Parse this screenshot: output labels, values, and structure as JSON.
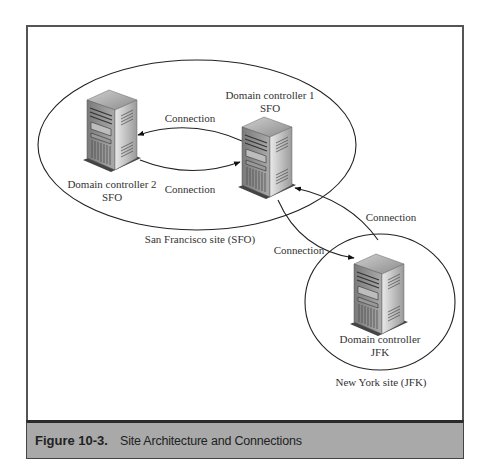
{
  "figure": {
    "number": "Figure 10-3.",
    "caption": "Site Architecture and Connections"
  },
  "sites": [
    {
      "id": "sfo",
      "label": "San Francisco site (SFO)"
    },
    {
      "id": "jfk",
      "label": "New York site (JFK)"
    }
  ],
  "servers": [
    {
      "id": "dc1",
      "line1": "Domain controller 1",
      "line2": "SFO",
      "icon": "server-tower-icon"
    },
    {
      "id": "dc2",
      "line1": "Domain controller 2",
      "line2": "SFO",
      "icon": "server-tower-icon"
    },
    {
      "id": "dcjfk",
      "line1": "Domain controller",
      "line2": "JFK",
      "icon": "server-tower-icon"
    }
  ],
  "connections": [
    {
      "from": "dc1",
      "to": "dc2",
      "label": "Connection"
    },
    {
      "from": "dc2",
      "to": "dc1",
      "label": "Connection"
    },
    {
      "from": "dcjfk",
      "to": "dc1",
      "label": "Connection"
    },
    {
      "from": "dc1",
      "to": "dcjfk",
      "label": "Connection"
    }
  ],
  "colors": {
    "caption_bg": "#a9a9a9",
    "line": "#222222",
    "frame": "#555555"
  }
}
